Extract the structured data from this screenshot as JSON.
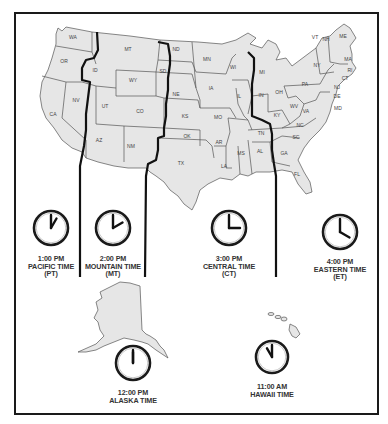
{
  "map": {
    "fill_color": "#e6e6e6",
    "border_color": "#555555",
    "zone_line_color": "#111111",
    "state_labels": [
      {
        "abbr": "WA",
        "x": 73,
        "y": 39
      },
      {
        "abbr": "OR",
        "x": 64,
        "y": 63
      },
      {
        "abbr": "CA",
        "x": 53,
        "y": 116
      },
      {
        "abbr": "NV",
        "x": 76,
        "y": 102
      },
      {
        "abbr": "ID",
        "x": 95,
        "y": 72
      },
      {
        "abbr": "MT",
        "x": 128,
        "y": 51
      },
      {
        "abbr": "WY",
        "x": 133,
        "y": 82
      },
      {
        "abbr": "UT",
        "x": 105,
        "y": 108
      },
      {
        "abbr": "CO",
        "x": 140,
        "y": 113
      },
      {
        "abbr": "AZ",
        "x": 99,
        "y": 142
      },
      {
        "abbr": "NM",
        "x": 131,
        "y": 148
      },
      {
        "abbr": "ND",
        "x": 176,
        "y": 51
      },
      {
        "abbr": "SD",
        "x": 163,
        "y": 73
      },
      {
        "abbr": "NE",
        "x": 176,
        "y": 96
      },
      {
        "abbr": "KS",
        "x": 185,
        "y": 118
      },
      {
        "abbr": "OK",
        "x": 187,
        "y": 138
      },
      {
        "abbr": "TX",
        "x": 181,
        "y": 165
      },
      {
        "abbr": "MN",
        "x": 207,
        "y": 61
      },
      {
        "abbr": "IA",
        "x": 211,
        "y": 90
      },
      {
        "abbr": "MO",
        "x": 218,
        "y": 119
      },
      {
        "abbr": "AR",
        "x": 219,
        "y": 144
      },
      {
        "abbr": "LA",
        "x": 224,
        "y": 168
      },
      {
        "abbr": "WI",
        "x": 233,
        "y": 69
      },
      {
        "abbr": "IL",
        "x": 239,
        "y": 98
      },
      {
        "abbr": "MS",
        "x": 241,
        "y": 155
      },
      {
        "abbr": "AL",
        "x": 260,
        "y": 153
      },
      {
        "abbr": "TN",
        "x": 261,
        "y": 135
      },
      {
        "abbr": "MI",
        "x": 262,
        "y": 74
      },
      {
        "abbr": "IN",
        "x": 261,
        "y": 97
      },
      {
        "abbr": "OH",
        "x": 279,
        "y": 94
      },
      {
        "abbr": "KY",
        "x": 277,
        "y": 117
      },
      {
        "abbr": "GA",
        "x": 284,
        "y": 155
      },
      {
        "abbr": "FL",
        "x": 297,
        "y": 176
      },
      {
        "abbr": "SC",
        "x": 296,
        "y": 139
      },
      {
        "abbr": "NC",
        "x": 300,
        "y": 127
      },
      {
        "abbr": "VA",
        "x": 306,
        "y": 113
      },
      {
        "abbr": "WV",
        "x": 294,
        "y": 108
      },
      {
        "abbr": "PA",
        "x": 305,
        "y": 86
      },
      {
        "abbr": "NY",
        "x": 317,
        "y": 67
      },
      {
        "abbr": "VT",
        "x": 315,
        "y": 39
      },
      {
        "abbr": "NH",
        "x": 326,
        "y": 41
      },
      {
        "abbr": "ME",
        "x": 343,
        "y": 38
      },
      {
        "abbr": "MA",
        "x": 348,
        "y": 61
      },
      {
        "abbr": "RI",
        "x": 350,
        "y": 72
      },
      {
        "abbr": "CT",
        "x": 345,
        "y": 80
      },
      {
        "abbr": "NJ",
        "x": 337,
        "y": 89
      },
      {
        "abbr": "DE",
        "x": 337,
        "y": 98
      },
      {
        "abbr": "MD",
        "x": 338,
        "y": 110
      }
    ]
  },
  "zones": [
    {
      "id": "pacific",
      "time": "1:00 PM",
      "name": "PACIFIC TIME",
      "abbr": "(PT)",
      "hour": 1
    },
    {
      "id": "mountain",
      "time": "2:00 PM",
      "name": "MOUNTAIN TIME",
      "abbr": "(MT)",
      "hour": 2
    },
    {
      "id": "central",
      "time": "3:00 PM",
      "name": "CENTRAL TIME",
      "abbr": "(CT)",
      "hour": 3
    },
    {
      "id": "eastern",
      "time": "4:00 PM",
      "name": "EASTERN TIME",
      "abbr": "(ET)",
      "hour": 4
    },
    {
      "id": "alaska",
      "time": "12:00 PM",
      "name": "ALASKA TIME",
      "hour": 12
    },
    {
      "id": "hawaii",
      "time": "11:00 AM",
      "name": "HAWAII TIME",
      "hour": 11
    }
  ]
}
